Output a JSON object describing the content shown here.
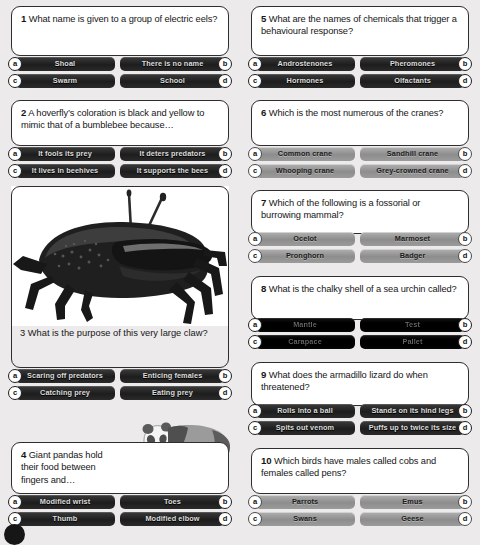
{
  "page": {
    "background": "#eceaea",
    "card_bg": "#ffffff",
    "dark_button": "#242424",
    "light_button": "#949494"
  },
  "option_letters": {
    "a": "a",
    "b": "b",
    "c": "c",
    "d": "d"
  },
  "images": [
    {
      "name": "crab-photo",
      "alt": "Fiddler crab with one very large claw"
    },
    {
      "name": "panda-illustration",
      "alt": "Giant panda walking"
    }
  ],
  "questions": [
    {
      "number": "1",
      "text": "What name is given to a group of electric eels?",
      "style": "dark",
      "options": {
        "a": "Shoal",
        "b": "There is no name",
        "c": "Swarm",
        "d": "School"
      }
    },
    {
      "number": "2",
      "text": "A hoverfly’s coloration is black and yellow to mimic that of a bumblebee because…",
      "style": "dark",
      "options": {
        "a": "It fools its prey",
        "b": "It deters predators",
        "c": "It lives in beehives",
        "d": "It supports the bees"
      }
    },
    {
      "number": "3",
      "text": "What is the purpose of this very large claw?",
      "style": "dark",
      "options": {
        "a": "Scaring off predators",
        "b": "Enticing females",
        "c": "Catching prey",
        "d": "Eating prey"
      }
    },
    {
      "number": "4",
      "text": "Giant pandas hold their food between fingers and…",
      "style": "dark",
      "options": {
        "a": "Modified wrist",
        "b": "Toes",
        "c": "Thumb",
        "d": "Modified elbow"
      }
    },
    {
      "number": "5",
      "text": "What are the names of chemicals that trigger a behavioural response?",
      "style": "dark",
      "options": {
        "a": "Androstenones",
        "b": "Pheromones",
        "c": "Hormones",
        "d": "Olfactants"
      }
    },
    {
      "number": "6",
      "text": "Which is the most numerous of the cranes?",
      "style": "light",
      "options": {
        "a": "Common crane",
        "b": "Sandhill crane",
        "c": "Whooping crane",
        "d": "Grey-crowned crane"
      }
    },
    {
      "number": "7",
      "text": "Which of the following is a fossorial or burrowing mammal?",
      "style": "light",
      "options": {
        "a": "Ocelot",
        "b": "Marmoset",
        "c": "Pronghorn",
        "d": "Badger"
      }
    },
    {
      "number": "8",
      "text": "What is the chalky shell of a sea urchin called?",
      "style": "murk",
      "options": {
        "a": "Mantle",
        "b": "Test",
        "c": "Carapace",
        "d": "Pallet"
      }
    },
    {
      "number": "9",
      "text": "What does the armadillo lizard do when threatened?",
      "style": "dark",
      "options": {
        "a": "Rolls into a ball",
        "b": "Stands on its hind legs",
        "c": "Spits out venom",
        "d": "Puffs up to twice its size"
      }
    },
    {
      "number": "10",
      "text": "Which birds have males called cobs and females called pens?",
      "style": "light",
      "options": {
        "a": "Parrots",
        "b": "Emus",
        "c": "Swans",
        "d": "Geese"
      }
    }
  ]
}
